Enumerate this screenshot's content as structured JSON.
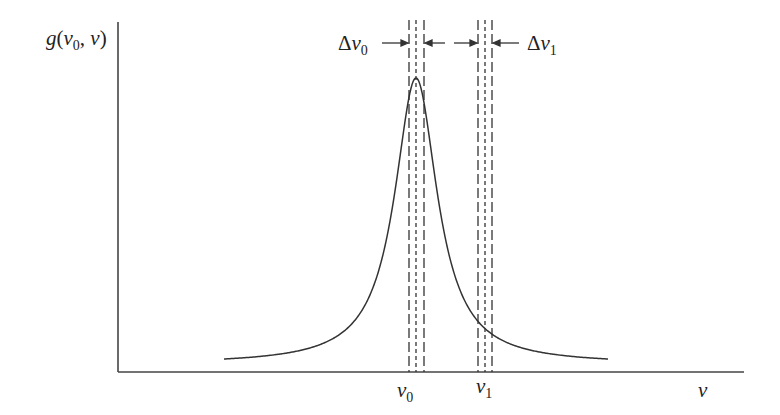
{
  "diagram": {
    "type": "spectral-lineshape",
    "y_axis_label": {
      "func": "g",
      "open": "(",
      "var0": "v",
      "sub0": "0",
      "sep": ", ",
      "var": "v",
      "close": ")"
    },
    "x_axis_label": "v",
    "ticks": [
      {
        "id": "v0",
        "base": "v",
        "sub": "0"
      },
      {
        "id": "v1",
        "base": "v",
        "sub": "1"
      }
    ],
    "bandwidth_labels": [
      {
        "id": "delta-v0",
        "delta": "Δ",
        "base": "v",
        "sub": "0"
      },
      {
        "id": "delta-v1",
        "delta": "Δ",
        "base": "v",
        "sub": "1"
      }
    ],
    "colors": {
      "line": "#333333",
      "text": "#222222",
      "background": "#ffffff"
    },
    "curve": {
      "shape": "lorentzian",
      "peak_at": "v0",
      "start_x": 224,
      "end_x": 608,
      "baseline_y": 359,
      "peak_y": 78
    }
  }
}
